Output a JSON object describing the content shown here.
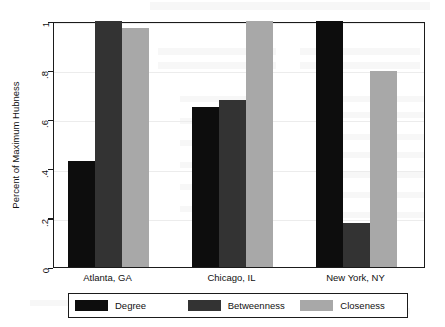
{
  "chart_data": {
    "type": "bar",
    "title": "",
    "subtitle": "",
    "xlabel": "",
    "ylabel": "Percent of Maximum Hubness",
    "categories": [
      "Atlanta, GA",
      "Chicago, IL",
      "New York, NY"
    ],
    "series": [
      {
        "name": "Degree",
        "color": "#0d0d0d",
        "values": [
          0.43,
          0.65,
          1.0
        ]
      },
      {
        "name": "Betweenness",
        "color": "#333333",
        "values": [
          1.0,
          0.68,
          0.18
        ]
      },
      {
        "name": "Closeness",
        "color": "#a8a8a8",
        "values": [
          0.97,
          1.0,
          0.795
        ]
      }
    ],
    "ylim": [
      0,
      1
    ],
    "yticks": [
      0,
      0.2,
      0.4,
      0.6,
      0.8,
      1
    ],
    "ytick_labels": [
      "0",
      ".2",
      ".4",
      ".6",
      ".8",
      "1"
    ],
    "grid": true,
    "legend_position": "bottom",
    "frame": true,
    "orientation": "vertical",
    "grouped": true
  },
  "axes": {
    "y_label": "Percent of Maximum Hubness",
    "y_tick_labels": [
      "0",
      ".2",
      ".4",
      ".6",
      ".8",
      "1"
    ],
    "x_tick_labels": [
      "Atlanta, GA",
      "Chicago, IL",
      "New York, NY"
    ]
  },
  "legend": {
    "items": [
      {
        "label": "Degree",
        "color": "#0d0d0d"
      },
      {
        "label": "Betweenness",
        "color": "#333333"
      },
      {
        "label": "Closeness",
        "color": "#a8a8a8"
      }
    ]
  },
  "colors": {
    "degree": "#0d0d0d",
    "betweenness": "#333333",
    "closeness": "#a8a8a8",
    "axis": "#1b1b1b",
    "grid": "#ececec",
    "background": "#ffffff"
  }
}
